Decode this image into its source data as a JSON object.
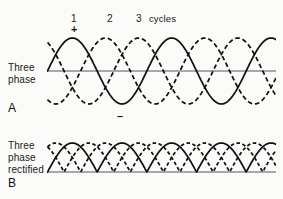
{
  "figure": {
    "background_color": "#fbfbf9",
    "ink_color": "#111111",
    "axis_color": "#8d8d8d"
  },
  "top_labels": {
    "cycle_1": "1",
    "cycle_2": "2",
    "cycle_3": "3",
    "cycles_word": "cycles",
    "plus_sign": "+",
    "minus_sign": "–"
  },
  "panels": [
    {
      "letter": "A",
      "label_line_1": "Three",
      "label_line_2": "phase",
      "label_line_3": ""
    },
    {
      "letter": "B",
      "label_line_1": "Three",
      "label_line_2": "phase",
      "label_line_3": "rectified"
    }
  ],
  "chart_data": {
    "type": "line",
    "xlabel": "cycles",
    "ylabel": "",
    "x_tick_labels": [
      "1",
      "2",
      "3"
    ],
    "x_tick_positions_cycles": [
      1,
      2,
      3
    ],
    "annotations": [
      "+",
      "–",
      "cycles",
      "A",
      "B"
    ],
    "grid": false,
    "legend_position": "none",
    "axis_baselines": {
      "panel_a_value": 0,
      "panel_b_value": 0
    },
    "panel_a": {
      "name": "Three phase",
      "description": "Three sinusoids 120 degrees apart, amplitude 1, plotted over about 2.3 cycles",
      "xlim": [
        0,
        2.3
      ],
      "ylim": [
        -1,
        1
      ],
      "cycles_shown": 2.3,
      "phase_offsets_degrees": [
        0,
        120,
        240
      ],
      "series": [
        {
          "name": "phase-1",
          "style": "solid",
          "amplitude": 1,
          "phase_deg": 0
        },
        {
          "name": "phase-2",
          "style": "dashed",
          "amplitude": 1,
          "phase_deg": 120
        },
        {
          "name": "phase-3",
          "style": "dashed",
          "amplitude": 1,
          "phase_deg": 240
        }
      ]
    },
    "panel_b": {
      "name": "Three phase rectified",
      "description": "Absolute value of the three sinusoids; all humps positive, six ripples per cycle",
      "xlim": [
        0,
        2.3
      ],
      "ylim": [
        0,
        1
      ],
      "cycles_shown": 2.3,
      "ripples_per_cycle": 6,
      "series": [
        {
          "name": "phase-1-rectified",
          "style": "solid",
          "amplitude": 1,
          "phase_deg": 0
        },
        {
          "name": "phase-2-rectified",
          "style": "dashed",
          "amplitude": 1,
          "phase_deg": 120
        },
        {
          "name": "phase-3-rectified",
          "style": "dashed",
          "amplitude": 1,
          "phase_deg": 240
        }
      ]
    }
  }
}
